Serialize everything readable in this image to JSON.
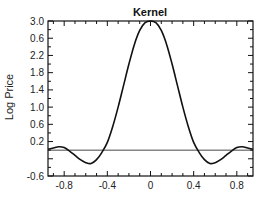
{
  "chart_data": {
    "type": "line",
    "title": "Kernel",
    "xlabel": "",
    "ylabel": "Log Price",
    "xlim": [
      -0.95,
      0.95
    ],
    "ylim": [
      -0.6,
      3.0
    ],
    "grid": false,
    "legend": null,
    "x_ticks": [
      -0.8,
      -0.4,
      0,
      0.4,
      0.8
    ],
    "x_tick_labels": [
      "-0.8",
      "-0.4",
      "0",
      "0.4",
      "0.8"
    ],
    "y_tick_labels": [
      "3.0",
      "0.6",
      "2.2",
      "1.8",
      "1.4",
      "1.0",
      "0.6",
      "0.2",
      "-0.6"
    ],
    "y_tick_values": [
      3.0,
      2.6,
      2.2,
      1.8,
      1.4,
      1.0,
      0.6,
      0.2,
      -0.6
    ],
    "reference_line": {
      "y": 0,
      "label": "baseline"
    },
    "series": [
      {
        "name": "Kernel",
        "x": [
          -0.95,
          -0.9,
          -0.85,
          -0.8,
          -0.75,
          -0.7,
          -0.65,
          -0.6,
          -0.55,
          -0.5,
          -0.45,
          -0.4,
          -0.35,
          -0.3,
          -0.25,
          -0.2,
          -0.15,
          -0.1,
          -0.05,
          0,
          0.05,
          0.1,
          0.15,
          0.2,
          0.25,
          0.3,
          0.35,
          0.4,
          0.45,
          0.5,
          0.55,
          0.6,
          0.65,
          0.7,
          0.75,
          0.8,
          0.85,
          0.9,
          0.95
        ],
        "values": [
          0.02,
          0.05,
          0.08,
          0.06,
          -0.02,
          -0.12,
          -0.22,
          -0.29,
          -0.31,
          -0.22,
          -0.05,
          0.18,
          0.55,
          1.0,
          1.5,
          2.0,
          2.45,
          2.78,
          2.96,
          3.0,
          2.96,
          2.78,
          2.45,
          2.0,
          1.5,
          1.0,
          0.55,
          0.18,
          -0.05,
          -0.22,
          -0.31,
          -0.29,
          -0.22,
          -0.12,
          -0.02,
          0.06,
          0.08,
          0.05,
          0.02
        ]
      }
    ]
  }
}
